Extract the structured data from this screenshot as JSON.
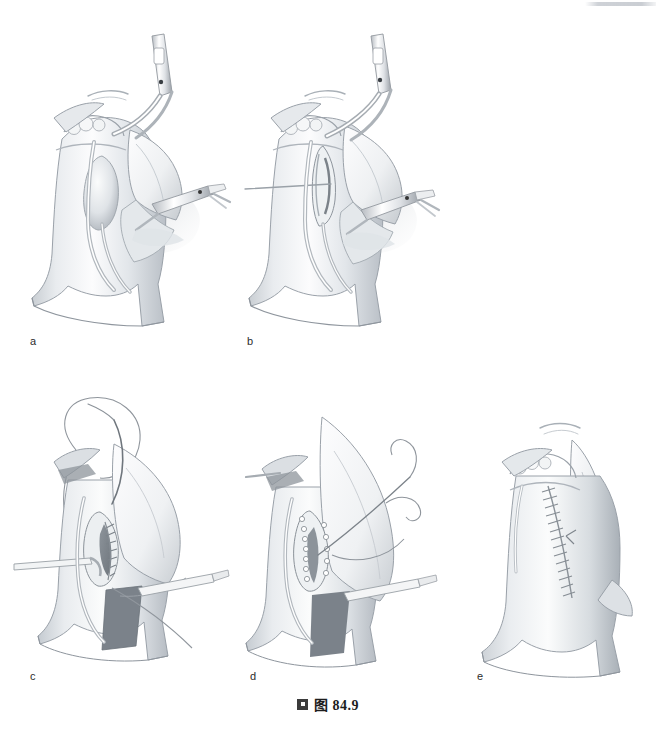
{
  "figure": {
    "caption_bullet_icon": "filled-square-bullet-icon",
    "caption_text": "图 84.9",
    "background_color": "#ffffff",
    "ink_color": "#6f757c",
    "shadow_color": "#b9bec4",
    "dark_lumen_color": "#787f86",
    "label_color": "#2c2c2c",
    "artifact_color": "#c6cad0",
    "width_px": 656,
    "height_px": 739
  },
  "panels": [
    {
      "id": "a",
      "label": "a",
      "label_x": 30,
      "label_y": 341,
      "title": "Dissection of vessel with right-angle clamp and scissors",
      "contents": [
        "trachea-or-vessel-trunk",
        "overlying-muscle-flap",
        "right-angle-dissecting-clamp",
        "scissors-instrument",
        "retracted-tissue-edge",
        "bifurcation-branch"
      ]
    },
    {
      "id": "b",
      "label": "b",
      "label_x": 247,
      "label_y": 341,
      "title": "Incision opened, pointer indicating site",
      "contents": [
        "trachea-or-vessel-trunk",
        "overlying-muscle-flap",
        "right-angle-dissecting-clamp",
        "scissors-instrument",
        "horizontal-pointer-line",
        "opened-incision",
        "bifurcation-branch"
      ]
    },
    {
      "id": "c",
      "label": "c",
      "label_x": 30,
      "label_y": 676,
      "title": "Suture placement through posterior wall with curved needle",
      "contents": [
        "trachea-or-vessel-trunk",
        "opened-lumen-dark",
        "curved-suture-needle",
        "long-suture-thread-loop",
        "running-suture-line",
        "retractor-instrument",
        "vessel-loop"
      ]
    },
    {
      "id": "d",
      "label": "d",
      "label_x": 250,
      "label_y": 676,
      "title": "Continuing anastomotic suture line",
      "contents": [
        "trachea-or-vessel-trunk",
        "opened-lumen-dark",
        "curved-suture-needle",
        "suture-thread-tails",
        "interrupted-suture-dots",
        "retractor-instrument"
      ]
    },
    {
      "id": "e",
      "label": "e",
      "label_x": 477,
      "label_y": 676,
      "title": "Completed closure with continuous suture line",
      "contents": [
        "trachea-or-vessel-trunk",
        "completed-suture-line",
        "adjacent-muscle-body",
        "bifurcation-branch"
      ]
    }
  ]
}
